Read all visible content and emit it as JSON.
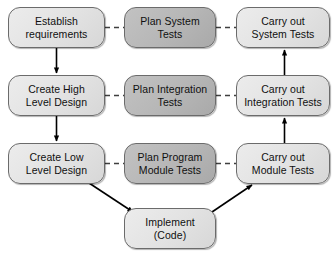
{
  "diagram": {
    "canvas": {
      "width": 336,
      "height": 256,
      "background": "#ffffff"
    },
    "colors": {
      "node_fill_light": "#e2e2e2",
      "node_fill_dark": "#b6b6b6",
      "node_border": "#6b6b6b",
      "edge_solid": "#000000",
      "edge_dashed": "#4d4d4d",
      "text": "#101010"
    },
    "columns": [
      {
        "name": "development",
        "fill": "light"
      },
      {
        "name": "test-planning",
        "fill": "dark"
      },
      {
        "name": "test-execution",
        "fill": "light"
      }
    ],
    "nodes": [
      {
        "id": "establish-requirements",
        "label": "Establish\nrequirements",
        "column": "development",
        "fill": "light",
        "x": 8,
        "y": 7,
        "w": 97,
        "h": 41
      },
      {
        "id": "plan-system-tests",
        "label": "Plan System\nTests",
        "column": "test-planning",
        "fill": "dark",
        "x": 124,
        "y": 7,
        "w": 92,
        "h": 41
      },
      {
        "id": "carry-out-system-tests",
        "label": "Carry out\nSystem Tests",
        "column": "test-execution",
        "fill": "light",
        "x": 236,
        "y": 7,
        "w": 94,
        "h": 41
      },
      {
        "id": "create-high-level-design",
        "label": "Create High\nLevel Design",
        "column": "development",
        "fill": "light",
        "x": 8,
        "y": 75,
        "w": 97,
        "h": 41
      },
      {
        "id": "plan-integration-tests",
        "label": "Plan Integration\nTests",
        "column": "test-planning",
        "fill": "dark",
        "x": 124,
        "y": 75,
        "w": 92,
        "h": 41
      },
      {
        "id": "carry-out-integration-tests",
        "label": "Carry out\nIntegration Tests",
        "column": "test-execution",
        "fill": "light",
        "x": 236,
        "y": 75,
        "w": 94,
        "h": 41
      },
      {
        "id": "create-low-level-design",
        "label": "Create Low\nLevel Design",
        "column": "development",
        "fill": "light",
        "x": 8,
        "y": 143,
        "w": 97,
        "h": 41
      },
      {
        "id": "plan-program-module-tests",
        "label": "Plan Program\nModule Tests",
        "column": "test-planning",
        "fill": "dark",
        "x": 124,
        "y": 143,
        "w": 92,
        "h": 41
      },
      {
        "id": "carry-out-module-tests",
        "label": "Carry out\nModule Tests",
        "column": "test-execution",
        "fill": "light",
        "x": 236,
        "y": 143,
        "w": 94,
        "h": 41
      },
      {
        "id": "implement-code",
        "label": "Implement\n(Code)",
        "column": "development",
        "fill": "light",
        "x": 124,
        "y": 208,
        "w": 92,
        "h": 41
      }
    ],
    "edges": [
      {
        "id": "req-to-high-level",
        "from": "establish-requirements",
        "to": "create-high-level-design",
        "style": "solid",
        "arrow": "end",
        "direction": "down"
      },
      {
        "id": "high-level-to-low-level",
        "from": "create-high-level-design",
        "to": "create-low-level-design",
        "style": "solid",
        "arrow": "end",
        "direction": "down"
      },
      {
        "id": "low-level-to-implement",
        "from": "create-low-level-design",
        "to": "implement-code",
        "style": "solid",
        "arrow": "end",
        "direction": "diagonal-down-right"
      },
      {
        "id": "implement-to-module-tests",
        "from": "implement-code",
        "to": "carry-out-module-tests",
        "style": "solid",
        "arrow": "end",
        "direction": "diagonal-up-right"
      },
      {
        "id": "module-to-integration-tests",
        "from": "carry-out-module-tests",
        "to": "carry-out-integration-tests",
        "style": "solid",
        "arrow": "end",
        "direction": "up"
      },
      {
        "id": "integration-to-system-tests",
        "from": "carry-out-integration-tests",
        "to": "carry-out-system-tests",
        "style": "solid",
        "arrow": "end",
        "direction": "up"
      },
      {
        "id": "requirements-to-plan-system",
        "from": "establish-requirements",
        "to": "plan-system-tests",
        "style": "dashed",
        "arrow": "none",
        "direction": "right"
      },
      {
        "id": "plan-system-to-carry-system",
        "from": "plan-system-tests",
        "to": "carry-out-system-tests",
        "style": "dashed",
        "arrow": "none",
        "direction": "right"
      },
      {
        "id": "high-level-to-plan-integration",
        "from": "create-high-level-design",
        "to": "plan-integration-tests",
        "style": "dashed",
        "arrow": "none",
        "direction": "right"
      },
      {
        "id": "plan-integration-to-carry-integration",
        "from": "plan-integration-tests",
        "to": "carry-out-integration-tests",
        "style": "dashed",
        "arrow": "none",
        "direction": "right"
      },
      {
        "id": "low-level-to-plan-module",
        "from": "create-low-level-design",
        "to": "plan-program-module-tests",
        "style": "dashed",
        "arrow": "none",
        "direction": "right"
      },
      {
        "id": "plan-module-to-carry-module",
        "from": "plan-program-module-tests",
        "to": "carry-out-module-tests",
        "style": "dashed",
        "arrow": "none",
        "direction": "right"
      }
    ]
  }
}
